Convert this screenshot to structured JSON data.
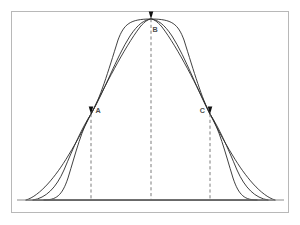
{
  "figure": {
    "title_visible": false,
    "background_color": "#ffffff",
    "frame": {
      "name": "figure-border",
      "x": 11.5,
      "y": 11.5,
      "width": 277,
      "height": 201,
      "stroke": "#b8b8b8",
      "stroke_width": 1
    },
    "baseline": {
      "name": "baseline-axis",
      "x1": 17,
      "x2": 284,
      "y": 200,
      "stroke": "#8a8a8a",
      "stroke_width": 1
    }
  },
  "chart_data": {
    "type": "line",
    "title": "",
    "xlabel": "",
    "ylabel": "",
    "grid": false,
    "legend_position": "none",
    "axis_ranges": {
      "x_px": [
        17,
        284
      ],
      "y_px": [
        19,
        200
      ]
    },
    "annotations": [
      {
        "label": "A",
        "x": 91,
        "y": 114,
        "marker": "filled-triangle",
        "label_side": "right"
      },
      {
        "label": "B",
        "x": 151,
        "y": 19,
        "marker": "filled-triangle",
        "label_side": "below-right"
      },
      {
        "label": "C",
        "x": 210,
        "y": 114,
        "marker": "filled-triangle",
        "label_side": "left"
      }
    ],
    "reference_lines": [
      {
        "name": "dashed-line-a",
        "x": 91,
        "y_top": 114,
        "y_bottom": 200,
        "style": "dashed"
      },
      {
        "name": "dashed-line-b",
        "x": 151,
        "y_top": 19,
        "y_bottom": 200,
        "style": "dashed"
      },
      {
        "name": "dashed-line-c",
        "x": 210,
        "y_top": 114,
        "y_bottom": 200,
        "style": "dashed"
      }
    ],
    "series": [
      {
        "name": "curve-plateau",
        "shape": "flat-top plateau",
        "stroke": "#2b2b2b",
        "path": "M 44,200 C 56,200 62,196 68,178 C 76,152 82,128 91,114 C 100,99 108,72 118,40 C 124,24 130,19 151,19 C 172,19 178,24 184,40 C 194,72 202,99 210,114 C 219,128 225,152 233,178 C 239,196 245,200 257,200 Z"
      },
      {
        "name": "curve-rounded",
        "shape": "rounded bell",
        "stroke": "#2b2b2b",
        "path": "M 33,200 C 46,198 56,188 64,170 C 74,146 82,128 91,114 C 104,92 116,58 130,36 C 138,24 144,20 151,19 C 158,20 164,24 172,36 C 186,58 198,92 210,114 C 219,128 227,146 237,170 C 245,188 255,198 268,200 Z"
      },
      {
        "name": "curve-peaked",
        "shape": "near-triangular peak",
        "stroke": "#2b2b2b",
        "path": "M 26,200 C 40,196 56,176 68,156 C 79,138 86,124 91,114 C 104,88 124,48 140,27 C 145,21 149,19 151,19 C 153,19 157,21 162,27 C 178,48 198,88 210,114 C 215,124 222,138 233,156 C 245,176 261,196 275,200 Z"
      }
    ]
  }
}
